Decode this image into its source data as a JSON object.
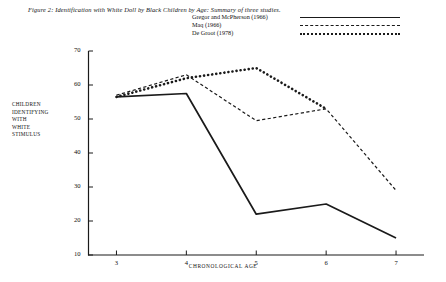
{
  "figure": {
    "title": "Figure 2: Identification with White Doll by Black Children by Age: Summary of three studies."
  },
  "legend": {
    "entries": [
      {
        "label": "Gregor and McPherson (1966)",
        "style": "solid"
      },
      {
        "label": "Maq (1966)",
        "style": "dashed"
      },
      {
        "label": "De Groot (1978)",
        "style": "dotted"
      }
    ]
  },
  "axes": {
    "y_title_lines": [
      "CHILDREN",
      "IDENTIFYING",
      "WITH",
      "WHITE",
      "STIMULUS"
    ],
    "x_title": "CHRONOLOGICAL AGE",
    "y_ticks": [
      "70",
      "60",
      "50",
      "40",
      "30",
      "20",
      "10"
    ],
    "x_ticks": [
      "3",
      "4",
      "5",
      "6",
      "7"
    ]
  },
  "chart_data": {
    "type": "line",
    "title": "Figure 2: Identification with White Doll by Black Children by Age: Summary of three studies.",
    "xlabel": "CHRONOLOGICAL AGE",
    "ylabel": "CHILDREN IDENTIFYING WITH WHITE STIMULUS",
    "x": [
      3,
      4,
      5,
      6,
      7
    ],
    "xlim": [
      2.6,
      7.4
    ],
    "ylim": [
      10,
      70
    ],
    "y_ticks": [
      70,
      60,
      50,
      40,
      30,
      20,
      10
    ],
    "x_ticks": [
      3,
      4,
      5,
      6,
      7
    ],
    "grid": false,
    "legend_position": "top-right",
    "series": [
      {
        "name": "Gregor and McPherson (1966)",
        "style": "solid",
        "color": "#1a1a1a",
        "x": [
          3,
          4,
          5,
          6,
          7
        ],
        "values": [
          56.5,
          57.5,
          22,
          25,
          15
        ]
      },
      {
        "name": "Maq (1966)",
        "style": "dashed",
        "color": "#1a1a1a",
        "x": [
          3,
          4,
          5,
          6,
          7
        ],
        "values": [
          57,
          63,
          49.5,
          53,
          29
        ]
      },
      {
        "name": "De Groot (1978)",
        "style": "dotted",
        "color": "#1a1a1a",
        "x": [
          3,
          4,
          5,
          6
        ],
        "values": [
          56.5,
          62,
          65,
          53
        ]
      }
    ]
  }
}
